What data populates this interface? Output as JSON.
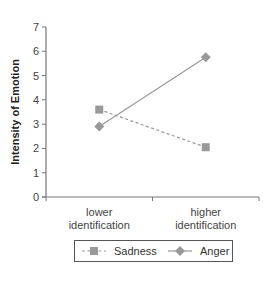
{
  "chart_data": {
    "type": "line",
    "title": "",
    "xlabel": "",
    "ylabel": "Intensity of Emotion",
    "ylim": [
      0,
      7
    ],
    "yticks": [
      0,
      1,
      2,
      3,
      4,
      5,
      6,
      7
    ],
    "categories": [
      "lower identification",
      "higher identification"
    ],
    "category_lines": [
      [
        "lower",
        "identification"
      ],
      [
        "higher",
        "identification"
      ]
    ],
    "series": [
      {
        "name": "Sadness",
        "values": [
          3.6,
          2.05
        ],
        "marker": "square",
        "line_style": "dashed",
        "color": "#999999"
      },
      {
        "name": "Anger",
        "values": [
          2.9,
          5.75
        ],
        "marker": "diamond",
        "line_style": "solid",
        "color": "#999999"
      }
    ],
    "grid": false,
    "legend_position": "bottom"
  }
}
